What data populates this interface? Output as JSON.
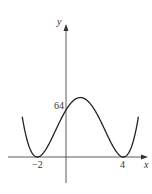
{
  "chart_data": {
    "type": "line",
    "title": "",
    "xlabel": "x",
    "ylabel": "y",
    "function_shape": "quartic with double roots at x=-2 and x=4, y-intercept 64",
    "x_ticks": [
      {
        "value": -2,
        "label": "−2"
      },
      {
        "value": 4,
        "label": "4"
      }
    ],
    "y_ticks": [
      {
        "value": 64,
        "label": "64"
      }
    ],
    "roots": [
      -2,
      4
    ],
    "y_intercept": 64,
    "local_max": {
      "x": 1,
      "y": 81
    },
    "series": [
      {
        "name": "y = (x+2)^2 (x-4)^2",
        "x": [
          -3.3,
          -3,
          -2.5,
          -2,
          -1.5,
          -1,
          -0.5,
          0,
          0.5,
          1,
          1.5,
          2,
          2.5,
          3,
          3.5,
          4,
          4.5,
          5,
          5.3
        ],
        "y": [
          204.4,
          49,
          10.6,
          0,
          7.6,
          25,
          45.6,
          64,
          76.6,
          81,
          76.6,
          64,
          45.6,
          25,
          7.6,
          0,
          10.6,
          49,
          105.6
        ]
      }
    ],
    "grid": false,
    "legend": "none"
  },
  "labels": {
    "x_axis": "x",
    "y_axis": "y",
    "tick_neg2": "−2",
    "tick_4": "4",
    "tick_64": "64"
  }
}
